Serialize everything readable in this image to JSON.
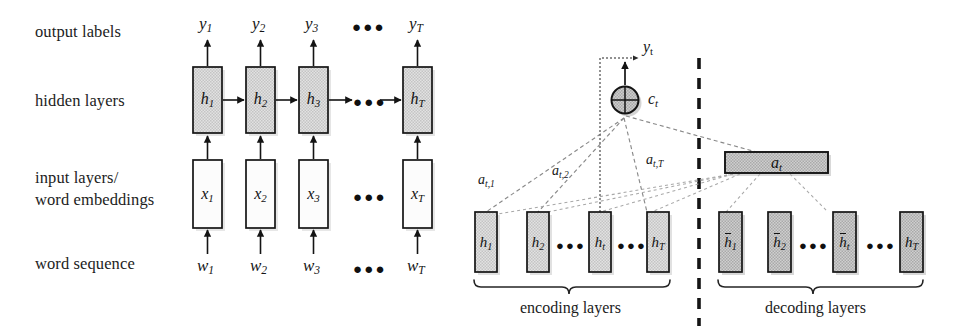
{
  "figure": {
    "background": "#ffffff",
    "ink": "#141414",
    "box_fill_shaded": "#d9d9d9",
    "box_fill_light": "#fbfbfb",
    "box_fill_dark": "#bdbdbd"
  },
  "left_panel": {
    "name": "rnn-sequence-labeling",
    "row_labels": [
      {
        "id": "output-labels",
        "text": "output labels"
      },
      {
        "id": "hidden-layers",
        "text": "hidden layers"
      },
      {
        "id": "input-layers",
        "line1": "input layers/",
        "line2": "word embeddings"
      },
      {
        "id": "word-sequence",
        "text": "word sequence"
      }
    ],
    "ellipsis": "●●●",
    "columns": [
      {
        "y": "y",
        "ysub": "1",
        "h": "h",
        "hsub": "1",
        "x": "x",
        "xsub": "1",
        "w": "w",
        "wsub": "1"
      },
      {
        "y": "y",
        "ysub": "2",
        "h": "h",
        "hsub": "2",
        "x": "x",
        "xsub": "2",
        "w": "w",
        "wsub": "2"
      },
      {
        "y": "y",
        "ysub": "3",
        "h": "h",
        "hsub": "3",
        "x": "x",
        "xsub": "3",
        "w": "w",
        "wsub": "3"
      },
      {
        "y": "y",
        "ysub": "T",
        "h": "h",
        "hsub": "T",
        "x": "x",
        "xsub": "T",
        "w": "w",
        "wsub": "T"
      }
    ]
  },
  "right_panel": {
    "name": "attention-encoder-decoder",
    "output_symbol": "y",
    "output_sub": "t",
    "context_symbol": "c",
    "context_sub": "t",
    "attention_vector_symbol": "a",
    "attention_vector_sub": "t",
    "attention_weights": [
      {
        "id": "a-t-1",
        "symbol": "a",
        "sub": "t,1"
      },
      {
        "id": "a-t-2",
        "symbol": "a",
        "sub": "t,2"
      },
      {
        "id": "a-t-T",
        "symbol": "a",
        "sub": "t,T"
      }
    ],
    "ellipsis": "●●●",
    "encoder_states": [
      {
        "id": "enc-h1",
        "symbol": "h",
        "sub": "1",
        "bar": false
      },
      {
        "id": "enc-h2",
        "symbol": "h",
        "sub": "2",
        "bar": false
      },
      {
        "id": "enc-ht",
        "symbol": "h",
        "sub": "t",
        "bar": false
      },
      {
        "id": "enc-hT",
        "symbol": "h",
        "sub": "T",
        "bar": false
      }
    ],
    "decoder_states": [
      {
        "id": "dec-h1",
        "symbol": "h",
        "sub": "1",
        "bar": true
      },
      {
        "id": "dec-h2",
        "symbol": "h",
        "sub": "2",
        "bar": true
      },
      {
        "id": "dec-ht",
        "symbol": "h",
        "sub": "t",
        "bar": true
      },
      {
        "id": "dec-hT",
        "symbol": "h",
        "sub": "T",
        "bar": false
      }
    ],
    "captions": {
      "encoding": "encoding layers",
      "decoding": "decoding layers"
    }
  }
}
